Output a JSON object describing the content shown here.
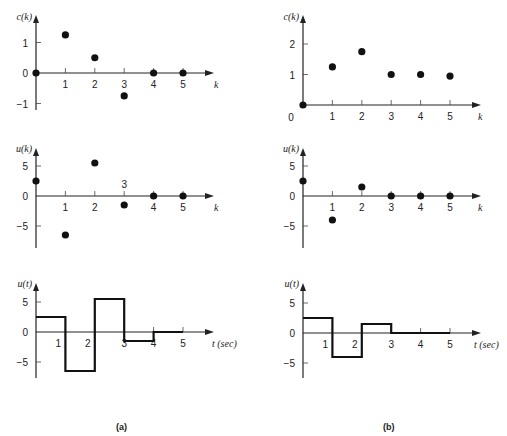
{
  "captions": {
    "left": "(a)",
    "right": "(b)"
  },
  "chart_data": [
    {
      "id": "a-ck",
      "panel": "(a)",
      "type": "scatter",
      "ylabel": "c(k)",
      "xlabel": "k",
      "x": [
        0,
        1,
        2,
        3,
        4,
        5
      ],
      "values": [
        0,
        1.25,
        0.5,
        -0.75,
        0,
        0
      ],
      "yticks": [
        -1,
        0,
        1
      ],
      "xticks": [
        1,
        2,
        3,
        4,
        5
      ],
      "ylim": [
        -1.2,
        2.0
      ],
      "grid": false
    },
    {
      "id": "a-uk",
      "panel": "(a)",
      "type": "scatter",
      "ylabel": "u(k)",
      "xlabel": "k",
      "x": [
        0,
        1,
        2,
        3,
        4,
        5
      ],
      "values": [
        2.5,
        -6.5,
        5.5,
        -1.5,
        0,
        0
      ],
      "yticks": [
        -5,
        0,
        5
      ],
      "xticks": [
        1,
        2,
        3,
        4,
        5
      ],
      "xtick_3_above_axis": true,
      "ylim": [
        -8,
        8
      ],
      "grid": false
    },
    {
      "id": "a-ut",
      "panel": "(a)",
      "type": "line",
      "step": true,
      "ylabel": "u(t)",
      "xlabel": "t (sec)",
      "x": [
        0,
        1,
        2,
        3,
        4,
        5
      ],
      "values": [
        2.5,
        -6.5,
        5.5,
        -1.5,
        0,
        0
      ],
      "yticks": [
        -5,
        0,
        5
      ],
      "xticks": [
        1,
        2,
        3,
        4,
        5
      ],
      "ylim": [
        -8,
        8
      ],
      "grid": false
    },
    {
      "id": "b-ck",
      "panel": "(b)",
      "type": "scatter",
      "ylabel": "c(k)",
      "xlabel": "k",
      "x": [
        0,
        1,
        2,
        3,
        4,
        5
      ],
      "values": [
        0,
        1.25,
        1.75,
        1.0,
        1.0,
        0.95
      ],
      "yticks": [
        0,
        1,
        2
      ],
      "xticks": [
        1,
        2,
        3,
        4,
        5
      ],
      "ylim": [
        0,
        2.6
      ],
      "grid": false
    },
    {
      "id": "b-uk",
      "panel": "(b)",
      "type": "scatter",
      "ylabel": "u(k)",
      "xlabel": "k",
      "x": [
        0,
        1,
        2,
        3,
        4,
        5
      ],
      "values": [
        2.5,
        -4,
        1.5,
        0,
        0,
        0
      ],
      "yticks": [
        -5,
        0,
        5
      ],
      "xticks": [
        1,
        2,
        3,
        4,
        5
      ],
      "ylim": [
        -8,
        8
      ],
      "grid": false
    },
    {
      "id": "b-ut",
      "panel": "(b)",
      "type": "line",
      "step": true,
      "ylabel": "u(t)",
      "xlabel": "t (sec)",
      "x": [
        0,
        1,
        2,
        3,
        4,
        5
      ],
      "values": [
        2.5,
        -4,
        1.5,
        0,
        0,
        0
      ],
      "yticks": [
        -5,
        0,
        5
      ],
      "xticks": [
        1,
        2,
        3,
        4,
        5
      ],
      "ylim": [
        -8,
        8
      ],
      "grid": false
    }
  ],
  "layout": [
    {
      "ox": 36,
      "oy": 73,
      "kx": 29.4,
      "ky": 30.5,
      "axTop": 15,
      "axBottom": 110,
      "axRight": 214,
      "xlabX": 214,
      "ylabY": 20,
      "zeroLabelLeft": true,
      "stepEnd": 5
    },
    {
      "ox": 36,
      "oy": 196,
      "kx": 29.4,
      "ky": 6.0,
      "axTop": 148,
      "axBottom": 248,
      "axRight": 214,
      "xlabX": 214,
      "ylabY": 152,
      "zeroLabelLeft": true,
      "stepEnd": 5
    },
    {
      "ox": 36,
      "oy": 332,
      "kx": 29.4,
      "ky": 6.0,
      "axTop": 283,
      "axBottom": 378,
      "axRight": 214,
      "xlabX": 212,
      "ylabY": 287,
      "zeroLabelLeft": true,
      "stepEnd": 5
    },
    {
      "ox": 303,
      "oy": 105,
      "kx": 29.4,
      "ky": 30.5,
      "axTop": 15,
      "axBottom": 105,
      "axRight": 481,
      "xlabX": 478,
      "ylabY": 20,
      "zeroLabelLeft": false,
      "stepEnd": 5
    },
    {
      "ox": 303,
      "oy": 196,
      "kx": 29.4,
      "ky": 6.0,
      "axTop": 148,
      "axBottom": 248,
      "axRight": 481,
      "xlabX": 478,
      "ylabY": 152,
      "zeroLabelLeft": true,
      "stepEnd": 5
    },
    {
      "ox": 303,
      "oy": 333,
      "kx": 29.4,
      "ky": 6.0,
      "axTop": 283,
      "axBottom": 378,
      "axRight": 481,
      "xlabX": 474,
      "ylabY": 287,
      "zeroLabelLeft": true,
      "stepEnd": 5
    }
  ]
}
